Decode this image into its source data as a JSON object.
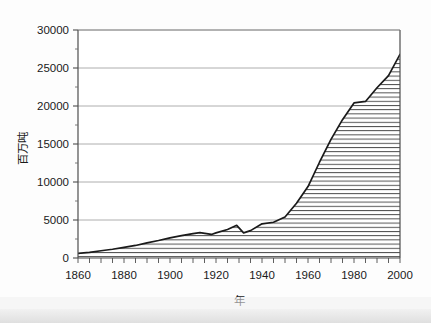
{
  "chart_data": {
    "type": "area",
    "title": "",
    "subtitle": "",
    "xlabel": "年",
    "ylabel": "百万吨",
    "xlim": [
      1860,
      2000
    ],
    "ylim": [
      0,
      30000
    ],
    "grid": true,
    "legend": null,
    "series_name": "",
    "fill_pattern": "horizontal-hatch",
    "line_color": "#1a1a1a",
    "grid_color": "#9a9a9a",
    "axis_color": "#4d4d4d",
    "y_ticks": [
      0,
      5000,
      10000,
      15000,
      20000,
      25000,
      30000
    ],
    "y_tick_labels": [
      "0",
      "5000",
      "10000",
      "15000",
      "20000",
      "25000",
      "30000"
    ],
    "y_minor_ticks": [
      2500,
      7500,
      12500,
      17500,
      22500,
      27500
    ],
    "x_ticks": [
      1860,
      1880,
      1900,
      1920,
      1940,
      1960,
      1980,
      2000
    ],
    "x_tick_labels": [
      "1860",
      "1880",
      "1900",
      "1920",
      "1940",
      "1960",
      "1980",
      "2000"
    ],
    "x_minor_tick_step": 5,
    "x": [
      1860,
      1865,
      1870,
      1875,
      1880,
      1885,
      1890,
      1895,
      1900,
      1905,
      1910,
      1913,
      1918,
      1920,
      1925,
      1929,
      1932,
      1935,
      1940,
      1945,
      1950,
      1955,
      1960,
      1965,
      1970,
      1975,
      1980,
      1985,
      1990,
      1995,
      2000
    ],
    "values": [
      600,
      750,
      950,
      1150,
      1400,
      1650,
      2000,
      2300,
      2650,
      2950,
      3200,
      3350,
      3100,
      3300,
      3750,
      4300,
      3300,
      3600,
      4500,
      4700,
      5400,
      7200,
      9400,
      12600,
      15600,
      18200,
      20400,
      20600,
      22400,
      24000,
      26800
    ],
    "annotations": []
  },
  "axis_labels": {
    "y_title": "百万吨",
    "x_title": "年"
  }
}
